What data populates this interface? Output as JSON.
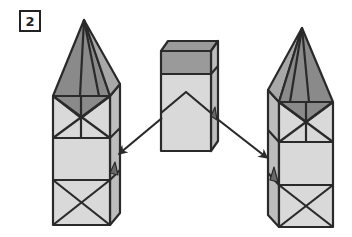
{
  "step": {
    "number": "2"
  },
  "colors": {
    "outline": "#2a2a2a",
    "face_light": "#d9d9d9",
    "face_side": "#bdbdbd",
    "roof_dark": "#8a8a8a",
    "roof_mid": "#a8a8a8",
    "band_dark": "#9a9a9a",
    "background": "#ffffff"
  },
  "figure": {
    "left_tower": {
      "segments": [
        "pyramid-roof",
        "x-braced box",
        "plain box",
        "x-braced box"
      ]
    },
    "center_piece": {
      "segments": [
        "dark top band",
        "light box with chevron"
      ]
    },
    "right_tower": {
      "segments": [
        "pyramid-roof",
        "x-braced box",
        "plain box",
        "x-braced box"
      ]
    },
    "arrows": [
      {
        "from": "center-piece",
        "to": "left-tower",
        "direction": "down-left"
      },
      {
        "from": "center-piece",
        "to": "right-tower",
        "direction": "down-right"
      }
    ]
  }
}
